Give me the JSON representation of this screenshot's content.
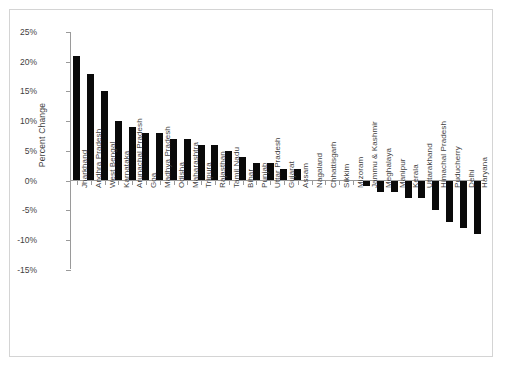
{
  "chart": {
    "type": "bar",
    "title": "",
    "ylabel": "Percent Change",
    "xlabel": ""
  },
  "chart_data": {
    "type": "bar",
    "title": "",
    "xlabel": "",
    "ylabel": "Percent Change",
    "ylim": [
      -15,
      25
    ],
    "ytick_labels": [
      "25%",
      "20%",
      "15%",
      "10%",
      "5%",
      "0%",
      "-5%",
      "-10%",
      "-15%"
    ],
    "ytick_values": [
      25,
      20,
      15,
      10,
      5,
      0,
      -5,
      -10,
      -15
    ],
    "grid": false,
    "legend": false,
    "bar_color": "#0a0a0a",
    "categories": [
      "Jharkhand",
      "Andhra Pradesh",
      "West Bengal",
      "Karnataka",
      "Arunachal Pradesh",
      "Goa",
      "Madhya Pradesh",
      "Odisha",
      "Maharashtra",
      "Tripura",
      "Rajasthan",
      "Tamil Nadu",
      "Bihar",
      "Punjab",
      "Uttar Pradesh",
      "Gujarat",
      "Assam",
      "Nagaland",
      "Chhattisgarh",
      "Sikkim",
      "Mizoram",
      "Jammu & Kashmir",
      "Meghalaya",
      "Manipur",
      "Kerala",
      "Uttarakhand",
      "Himachal Pradesh",
      "Puducherry",
      "Delhi",
      "Haryana"
    ],
    "values": [
      21,
      18,
      15,
      10,
      9,
      8,
      8,
      7,
      7,
      6,
      6,
      5,
      4,
      3,
      3,
      2,
      2,
      0,
      0,
      0,
      0,
      -1,
      -2,
      -2,
      -3,
      -3,
      -5,
      -7,
      -8,
      -9
    ]
  }
}
